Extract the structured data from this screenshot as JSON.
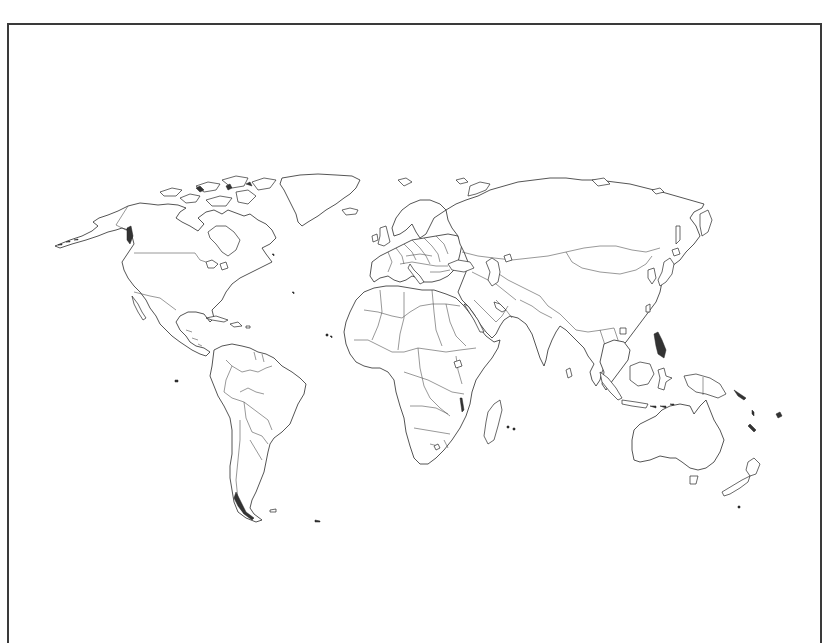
{
  "map": {
    "type": "world-outline",
    "projection": "robinson",
    "title": "",
    "labels": [],
    "style": {
      "land_fill": "#ffffff",
      "stroke": "#2a2a2a",
      "frame_color": "#3a3a3a",
      "background": "#ffffff"
    },
    "regions": [
      {
        "name": "North America"
      },
      {
        "name": "Greenland"
      },
      {
        "name": "South America"
      },
      {
        "name": "Europe"
      },
      {
        "name": "Africa"
      },
      {
        "name": "Asia"
      },
      {
        "name": "Australia"
      },
      {
        "name": "New Zealand"
      },
      {
        "name": "Madagascar"
      }
    ]
  }
}
